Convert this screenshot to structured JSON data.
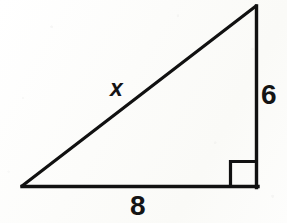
{
  "figure": {
    "name": "right-triangle",
    "background_color": "#fdfdfb",
    "stroke_color": "#111111",
    "stroke_width": 3,
    "canvas": {
      "width": 287,
      "height": 223
    }
  },
  "geometry": {
    "vertices": {
      "left": {
        "x": 22,
        "y": 186
      },
      "top": {
        "x": 256,
        "y": 6
      },
      "bottom_right": {
        "x": 257,
        "y": 187
      }
    },
    "right_angle_marker": {
      "x": 230,
      "y": 161,
      "size": 26,
      "at_vertex": "bottom_right"
    }
  },
  "labels": {
    "hypotenuse": {
      "text": "x",
      "style": "italic",
      "side": "hypotenuse",
      "meaning": "unknown-length"
    },
    "vertical_leg": {
      "text": "6",
      "side": "vertical-leg",
      "meaning": "length"
    },
    "horizontal_leg": {
      "text": "8",
      "side": "horizontal-leg",
      "meaning": "length"
    }
  }
}
